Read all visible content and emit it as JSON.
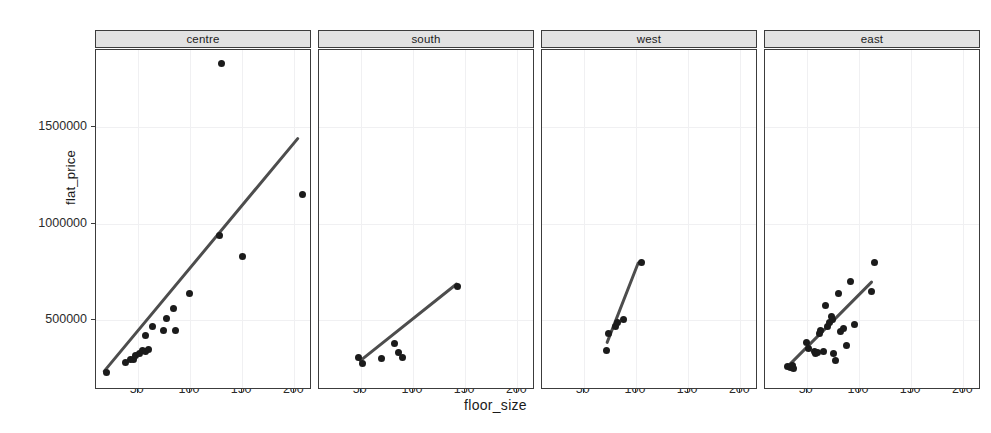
{
  "chart_data": {
    "type": "scatter",
    "title": "",
    "xlabel": "floor_size",
    "ylabel": "flat_price",
    "xlim": [
      10,
      215
    ],
    "ylim": [
      150000,
      1900000
    ],
    "xticks": [
      50,
      100,
      150,
      200
    ],
    "xticklabels": [
      "50",
      "100",
      "150",
      "200"
    ],
    "yticks": [
      500000,
      1000000,
      1500000
    ],
    "yticklabels": [
      "500000",
      "1000000",
      "1500000"
    ],
    "grid": true,
    "legend": "none",
    "facet_variable": "region",
    "annotation": "Each panel shows flat_price vs floor_size with a linear fit line",
    "panels": [
      {
        "label": "centre",
        "points": [
          {
            "x": 20,
            "y": 230000
          },
          {
            "x": 38,
            "y": 280000
          },
          {
            "x": 43,
            "y": 300000
          },
          {
            "x": 46,
            "y": 300000
          },
          {
            "x": 48,
            "y": 320000
          },
          {
            "x": 52,
            "y": 330000
          },
          {
            "x": 55,
            "y": 345000
          },
          {
            "x": 57,
            "y": 340000
          },
          {
            "x": 60,
            "y": 350000
          },
          {
            "x": 57,
            "y": 420000
          },
          {
            "x": 64,
            "y": 470000
          },
          {
            "x": 75,
            "y": 450000
          },
          {
            "x": 78,
            "y": 510000
          },
          {
            "x": 84,
            "y": 560000
          },
          {
            "x": 86,
            "y": 450000
          },
          {
            "x": 100,
            "y": 640000
          },
          {
            "x": 128,
            "y": 940000
          },
          {
            "x": 130,
            "y": 1830000
          },
          {
            "x": 150,
            "y": 830000
          },
          {
            "x": 208,
            "y": 1150000
          }
        ],
        "fit": {
          "x1": 18,
          "y1": 225000,
          "x2": 205,
          "y2": 1440000
        }
      },
      {
        "label": "south",
        "points": [
          {
            "x": 48,
            "y": 310000
          },
          {
            "x": 52,
            "y": 275000
          },
          {
            "x": 70,
            "y": 305000
          },
          {
            "x": 82,
            "y": 380000
          },
          {
            "x": 86,
            "y": 335000
          },
          {
            "x": 90,
            "y": 310000
          },
          {
            "x": 143,
            "y": 675000
          }
        ],
        "fit": {
          "x1": 50,
          "y1": 280000,
          "x2": 143,
          "y2": 680000
        }
      },
      {
        "label": "west",
        "points": [
          {
            "x": 72,
            "y": 345000
          },
          {
            "x": 74,
            "y": 430000
          },
          {
            "x": 80,
            "y": 470000
          },
          {
            "x": 82,
            "y": 490000
          },
          {
            "x": 88,
            "y": 505000
          },
          {
            "x": 105,
            "y": 800000
          }
        ],
        "fit": {
          "x1": 73,
          "y1": 375000,
          "x2": 103,
          "y2": 790000
        }
      },
      {
        "label": "east",
        "points": [
          {
            "x": 32,
            "y": 260000
          },
          {
            "x": 34,
            "y": 255000
          },
          {
            "x": 36,
            "y": 265000
          },
          {
            "x": 37,
            "y": 250000
          },
          {
            "x": 50,
            "y": 385000
          },
          {
            "x": 52,
            "y": 355000
          },
          {
            "x": 57,
            "y": 340000
          },
          {
            "x": 58,
            "y": 330000
          },
          {
            "x": 60,
            "y": 335000
          },
          {
            "x": 62,
            "y": 430000
          },
          {
            "x": 63,
            "y": 450000
          },
          {
            "x": 66,
            "y": 340000
          },
          {
            "x": 68,
            "y": 575000
          },
          {
            "x": 70,
            "y": 470000
          },
          {
            "x": 72,
            "y": 490000
          },
          {
            "x": 74,
            "y": 520000
          },
          {
            "x": 75,
            "y": 505000
          },
          {
            "x": 76,
            "y": 330000
          },
          {
            "x": 78,
            "y": 290000
          },
          {
            "x": 80,
            "y": 640000
          },
          {
            "x": 82,
            "y": 440000
          },
          {
            "x": 85,
            "y": 460000
          },
          {
            "x": 88,
            "y": 370000
          },
          {
            "x": 92,
            "y": 700000
          },
          {
            "x": 96,
            "y": 480000
          },
          {
            "x": 112,
            "y": 650000
          },
          {
            "x": 115,
            "y": 800000
          }
        ],
        "fit": {
          "x1": 33,
          "y1": 255000,
          "x2": 113,
          "y2": 690000
        }
      }
    ]
  }
}
